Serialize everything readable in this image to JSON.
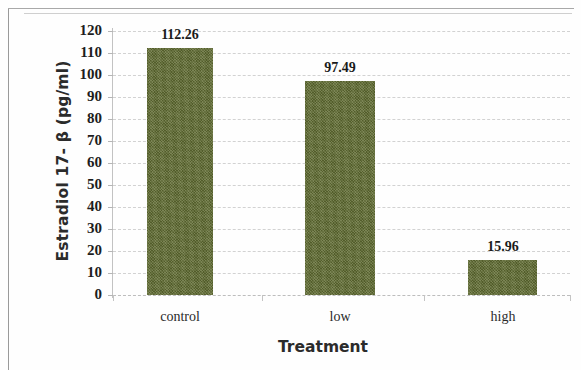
{
  "chart_data": {
    "type": "bar",
    "title": "",
    "xlabel": "Treatment",
    "ylabel": "Estradiol 17- β  (pg/ml)",
    "categories": [
      "control",
      "low",
      "high"
    ],
    "values": [
      112.26,
      97.49,
      15.96
    ],
    "value_labels": [
      "112.26",
      "97.49",
      "15.96"
    ],
    "ylim": [
      0,
      120
    ],
    "ytick_step": 10,
    "yticks": [
      0,
      10,
      20,
      30,
      40,
      50,
      60,
      70,
      80,
      90,
      100,
      110,
      120
    ],
    "ytick_labels": [
      "0",
      "10",
      "20",
      "30",
      "40",
      "50",
      "60",
      "70",
      "80",
      "90",
      "100",
      "110",
      "120"
    ],
    "grid": true,
    "grid_axis": "y",
    "legend": false,
    "legend_position": "none",
    "series": [
      {
        "name": "Estradiol 17-beta",
        "values": [
          112.26,
          97.49,
          15.96
        ],
        "color": "#5e6a30"
      }
    ],
    "bar_color": "#5e6a30",
    "gridline_color": "#d2d2d2",
    "axis_color": "#c2c2c2",
    "text_color": "#1d1d1d"
  }
}
